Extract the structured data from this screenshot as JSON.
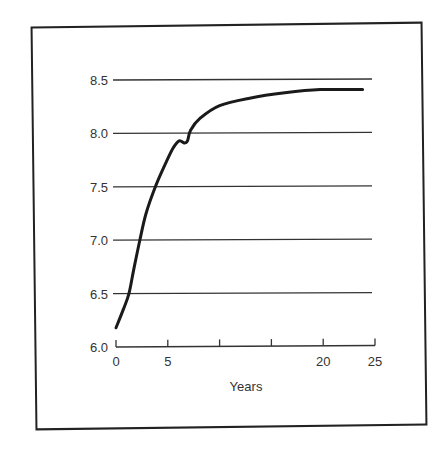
{
  "chart_data": {
    "type": "line",
    "title": "",
    "xlabel": "Years",
    "ylabel": "",
    "xlim": [
      0,
      25
    ],
    "ylim": [
      6.0,
      8.5
    ],
    "x_ticks": [
      0,
      5,
      10,
      15,
      20,
      25
    ],
    "x_tick_labels": [
      "0",
      "5",
      "",
      "",
      "20",
      "25"
    ],
    "y_ticks": [
      6.0,
      6.5,
      7.0,
      7.5,
      8.0,
      8.5
    ],
    "y_tick_labels": [
      "6.0",
      "6.5",
      "7.0",
      "7.5",
      "8.0",
      "8.5"
    ],
    "grid": "horizontal",
    "legend": null,
    "series": [
      {
        "name": "curve",
        "x": [
          0,
          0.7,
          1.25,
          1.7,
          2.3,
          2.9,
          3.8,
          4.7,
          5.5,
          6.1,
          6.6,
          6.9,
          7.2,
          8.1,
          10.0,
          12.9,
          16.3,
          19.7,
          23.8
        ],
        "values": [
          6.18,
          6.35,
          6.5,
          6.72,
          7.0,
          7.25,
          7.5,
          7.7,
          7.86,
          7.93,
          7.91,
          7.93,
          8.03,
          8.14,
          8.26,
          8.33,
          8.38,
          8.41,
          8.41
        ]
      }
    ]
  },
  "colors": {
    "line": "#1a1a1a",
    "grid": "#333333",
    "frame": "#222222",
    "text": "#333333"
  }
}
